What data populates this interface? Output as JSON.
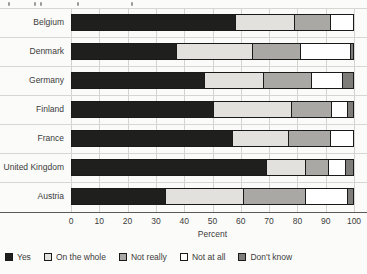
{
  "chart_data": {
    "type": "bar",
    "stacked": true,
    "orientation": "horizontal",
    "title": "",
    "categories": [
      "Belgium",
      "Denmark",
      "Germany",
      "Finland",
      "France",
      "United Kingdom",
      "Austria"
    ],
    "series": [
      {
        "name": "Yes",
        "color": "#1f1f1d",
        "values": [
          58,
          37,
          47,
          50,
          57,
          69,
          33
        ]
      },
      {
        "name": "On the whole",
        "color": "#e2e1dd",
        "values": [
          21,
          27,
          21,
          28,
          20,
          14,
          28
        ]
      },
      {
        "name": "Not really",
        "color": "#a9a8a4",
        "values": [
          13,
          17,
          17,
          14,
          15,
          8,
          22
        ]
      },
      {
        "name": "Not at all",
        "color": "#ffffff",
        "values": [
          8,
          18,
          11,
          6,
          8,
          6,
          15
        ]
      },
      {
        "name": "Don't know",
        "color": "#7e7d79",
        "values": [
          0,
          1,
          4,
          2,
          0,
          3,
          2
        ]
      }
    ],
    "xlabel": "Percent",
    "xlim": [
      0,
      100
    ],
    "xticks": [
      0,
      10,
      20,
      30,
      40,
      50,
      60,
      70,
      80,
      90,
      100
    ],
    "grid": true,
    "legend_position": "bottom",
    "colors": {
      "gridline": "#d3d3cf",
      "row_separator": "#d6d6d2",
      "axis_line": "#5a5a58",
      "bar_border": "#1a1a1a",
      "background": "#fbfbf9",
      "text": "#3c3c3c"
    }
  }
}
